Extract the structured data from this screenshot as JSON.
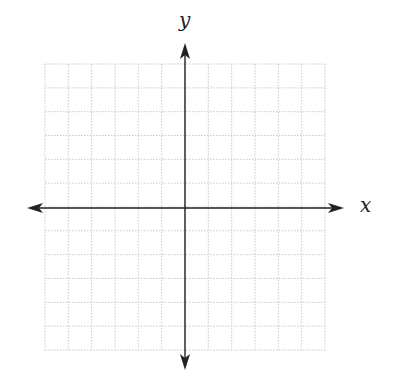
{
  "diagram": {
    "type": "cartesian-coordinate-plane",
    "x_axis_label": "x",
    "y_axis_label": "y",
    "grid": {
      "columns": 12,
      "rows": 12,
      "left": 45,
      "top": 64,
      "right": 325,
      "bottom": 350,
      "line_style": "dotted",
      "line_color": "#c8c8c8"
    },
    "origin": {
      "x": 185,
      "y": 208
    },
    "x_axis": {
      "y": 208,
      "x_start": 27,
      "x_end": 344,
      "arrows": "both"
    },
    "y_axis": {
      "x": 185,
      "y_start": 43,
      "y_end": 370,
      "arrows": "both"
    },
    "axis_color": "#222222"
  }
}
